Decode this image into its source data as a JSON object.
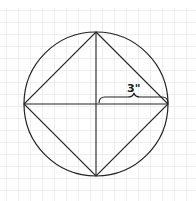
{
  "diagram": {
    "title": "",
    "radius_label": "3\"",
    "colors": {
      "stroke": "#222222",
      "grid": "#eeeeee",
      "background": "#ffffff"
    },
    "circle": {
      "cx": 96,
      "cy": 104,
      "r": 72
    },
    "square_vertices": [
      {
        "name": "top",
        "x": 96,
        "y": 32
      },
      {
        "name": "right",
        "x": 168,
        "y": 104
      },
      {
        "name": "bottom",
        "x": 96,
        "y": 176
      },
      {
        "name": "left",
        "x": 24,
        "y": 104
      }
    ]
  }
}
